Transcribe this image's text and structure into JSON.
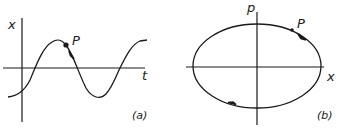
{
  "panel_a": {
    "y_axis_label": "x",
    "x_axis_label": "t",
    "point_label": "P",
    "caption": "(a)",
    "curve": "sinusoid"
  },
  "panel_b": {
    "y_axis_label": "p",
    "x_axis_label": "x",
    "point_label": "P",
    "caption": "(b)",
    "curve": "ellipse",
    "direction": "clockwise"
  }
}
